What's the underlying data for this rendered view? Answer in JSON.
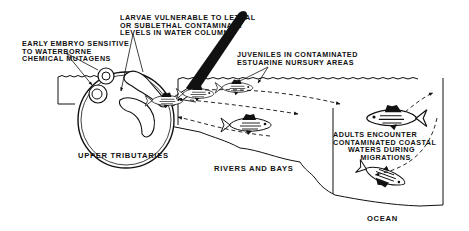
{
  "diagram": {
    "type": "life-cycle illustration",
    "colors": {
      "ink": "#111111",
      "background": "#ffffff"
    },
    "annotations": {
      "early_embryo": "EARLY EMBRYO SENSITIVE\nTO WATERBORNE\nCHEMICAL MUTAGENS",
      "larvae": "LARVAE VULNERABLE TO LETHAL\nOR SUBLETHAL CONTAMINANT\nLEVELS IN WATER COLUMN",
      "juveniles": "JUVENILES IN CONTAMINATED\nESTUARINE NURSURY AREAS",
      "adults": "ADULTS ENCOUNTER\nCONTAMINATED COASTAL\n      WATERS DURING\n           MIGRATIONS"
    },
    "regions": {
      "upper_tributaries": "UPPER TRIBUTARIES",
      "rivers_and_bays": "RIVERS AND BAYS",
      "ocean": "OCEAN"
    },
    "elements": {
      "magnifier": "magnifying-glass",
      "embryos": [
        "embryo-1",
        "embryo-2"
      ],
      "larvae": [
        "larva-1",
        "larva-2"
      ],
      "fish": [
        "juvenile-fish-1",
        "juvenile-fish-2",
        "juvenile-fish-3",
        "adult-fish-1",
        "adult-fish-2"
      ],
      "migration_arrows": [
        "upstream-arrow",
        "downstream-arrow",
        "offshore-arrow",
        "return-arrow"
      ]
    }
  }
}
